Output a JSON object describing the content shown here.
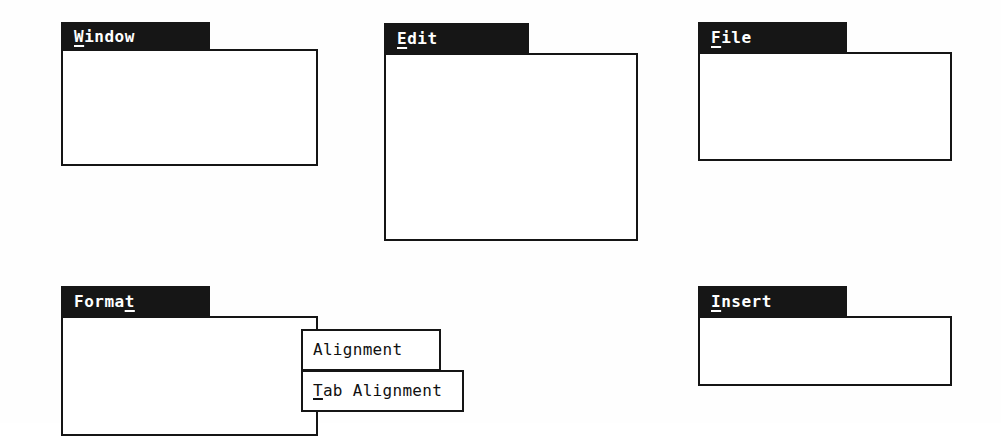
{
  "diagram": {
    "colors": {
      "title_bar_bg": "#161616",
      "title_bar_text": "#ffffff",
      "panel_bg": "#ffffff",
      "panel_border": "#151515",
      "text": "#111111",
      "page_bg": "#ffffff"
    }
  },
  "menus": {
    "window": {
      "title_pre": "W",
      "title_post": "indow",
      "items": [
        {
          "pre": "A",
          "post": "rrange all"
        }
      ],
      "italic_item": "<filenames>"
    },
    "edit": {
      "title_pre": "E",
      "title_post": "dit",
      "items": [
        {
          "lead": "",
          "pre": "C",
          "post": "opy"
        },
        {
          "lead": "",
          "pre": "P",
          "post": "aste"
        },
        {
          "lead": "",
          "pre": "F",
          "post": "ind"
        },
        {
          "lead": "R",
          "pre": "e",
          "post": "place"
        }
      ]
    },
    "file": {
      "title_pre": "F",
      "title_post": "ile",
      "items": [
        {
          "lead": "",
          "pre": "N",
          "post": "ew"
        },
        {
          "lead": "Print ",
          "pre": "M",
          "post": "erge"
        }
      ]
    },
    "format": {
      "title_pre": "Forma",
      "title_post": "t",
      "items": [
        {
          "lead": "",
          "pre": "P",
          "post": "aragraph",
          "arrow": "submenu-arrow"
        },
        {
          "lead": "",
          "pre": "T",
          "post": "abs",
          "arrow": "submenu-arrow"
        }
      ],
      "submenus": [
        {
          "lead": "Alignment",
          "pre": "",
          "post": ""
        },
        {
          "lead": "",
          "pre": "T",
          "post": "ab Alignment"
        }
      ]
    },
    "insert": {
      "title_pre": "I",
      "title_post": "nsert",
      "items": [
        {
          "lead": "Date and ",
          "pre": "T",
          "post": "ime"
        }
      ]
    }
  }
}
